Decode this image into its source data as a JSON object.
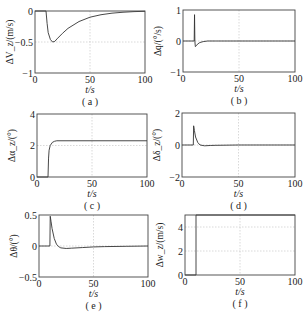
{
  "chart_data": [
    {
      "type": "line",
      "panel": "(a)",
      "title": "",
      "xlabel": "t/s",
      "ylabel": "ΔV_z/(m/s)",
      "xlim": [
        0,
        100
      ],
      "ylim": [
        -1,
        0
      ],
      "xticks": [
        "0",
        "50",
        "100"
      ],
      "yticks": [
        "-1",
        "-0.5",
        "0"
      ],
      "grid": true,
      "x": [
        0,
        10,
        11,
        12,
        14,
        16,
        18,
        20,
        25,
        30,
        40,
        50,
        60,
        70,
        80,
        90,
        100
      ],
      "series": [
        {
          "name": "ΔV_z",
          "values": [
            0,
            0,
            -0.2,
            -0.35,
            -0.46,
            -0.5,
            -0.49,
            -0.45,
            -0.36,
            -0.28,
            -0.17,
            -0.1,
            -0.06,
            -0.035,
            -0.02,
            -0.01,
            -0.005
          ]
        }
      ]
    },
    {
      "type": "line",
      "panel": "(b)",
      "title": "",
      "xlabel": "t/s",
      "ylabel": "Δq/(°/s)",
      "xlim": [
        0,
        100
      ],
      "ylim": [
        -1,
        1
      ],
      "xticks": [
        "0",
        "50",
        "100"
      ],
      "yticks": [
        "-1",
        "0",
        "1"
      ],
      "grid": true,
      "x": [
        0,
        10,
        10.3,
        10.6,
        11,
        12,
        13,
        15,
        18,
        22,
        30,
        50,
        100
      ],
      "series": [
        {
          "name": "Δq",
          "values": [
            0,
            0,
            0.85,
            0.0,
            -0.18,
            -0.15,
            -0.1,
            -0.05,
            -0.02,
            0,
            0,
            0,
            0
          ]
        }
      ]
    },
    {
      "type": "line",
      "panel": "(c)",
      "title": "",
      "xlabel": "t/s",
      "ylabel": "Δα_z/(°)",
      "xlim": [
        0,
        100
      ],
      "ylim": [
        0,
        4
      ],
      "xticks": [
        "0",
        "50",
        "100"
      ],
      "yticks": [
        "0",
        "2",
        "4"
      ],
      "grid": true,
      "x": [
        0,
        10,
        10.5,
        11,
        12,
        14,
        16,
        18,
        20,
        30,
        50,
        100
      ],
      "series": [
        {
          "name": "Δα_z",
          "values": [
            0,
            0,
            1.2,
            1.7,
            2.0,
            2.2,
            2.27,
            2.3,
            2.3,
            2.3,
            2.3,
            2.3
          ]
        }
      ]
    },
    {
      "type": "line",
      "panel": "(d)",
      "title": "",
      "xlabel": "t/s",
      "ylabel": "Δδ_z/(°)",
      "xlim": [
        0,
        100
      ],
      "ylim": [
        -2,
        2
      ],
      "xticks": [
        "0",
        "50",
        "100"
      ],
      "yticks": [
        "-2",
        "0",
        "2"
      ],
      "grid": true,
      "x": [
        0,
        10,
        10.3,
        11,
        12,
        14,
        16,
        20,
        25,
        30,
        50,
        100
      ],
      "series": [
        {
          "name": "Δδ_z",
          "values": [
            0,
            0,
            1.2,
            0.9,
            0.5,
            0.15,
            0.0,
            -0.05,
            -0.03,
            -0.02,
            0,
            0
          ]
        }
      ]
    },
    {
      "type": "line",
      "panel": "(e)",
      "title": "",
      "xlabel": "t/s",
      "ylabel": "Δθ/(°)",
      "xlim": [
        0,
        100
      ],
      "ylim": [
        -0.5,
        0.5
      ],
      "xticks": [
        "0",
        "50",
        "100"
      ],
      "yticks": [
        "-0.5",
        "0",
        "0.5"
      ],
      "grid": true,
      "x": [
        0,
        10,
        10.3,
        11,
        12,
        14,
        16,
        18,
        20,
        25,
        30,
        40,
        50,
        60,
        80,
        100
      ],
      "series": [
        {
          "name": "Δθ",
          "values": [
            0,
            0,
            0.48,
            0.4,
            0.28,
            0.12,
            0.03,
            -0.01,
            -0.03,
            -0.04,
            -0.035,
            -0.025,
            -0.015,
            -0.01,
            -0.005,
            0
          ]
        }
      ]
    },
    {
      "type": "line",
      "panel": "(f)",
      "title": "",
      "xlabel": "t/s",
      "ylabel": "Δw_z/(m/s)",
      "xlim": [
        0,
        100
      ],
      "ylim": [
        0,
        5
      ],
      "xticks": [
        "0",
        "50",
        "100"
      ],
      "yticks": [
        "0",
        "2",
        "4"
      ],
      "grid": true,
      "x": [
        0,
        10,
        10.01,
        100
      ],
      "series": [
        {
          "name": "Δw_z",
          "values": [
            0,
            0,
            5,
            5
          ]
        }
      ]
    }
  ],
  "captions": [
    "( a )",
    "( b )",
    "( c )",
    "( d )",
    "( e )",
    "( f )"
  ],
  "xlabel_text": "t/s"
}
